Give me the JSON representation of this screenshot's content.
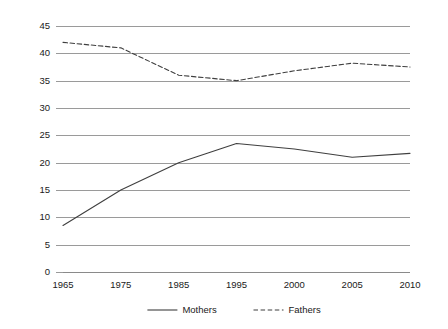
{
  "chart_data": {
    "type": "line",
    "title": "",
    "subtitle": "",
    "xlabel": "",
    "ylabel": "",
    "categories": [
      "1965",
      "1975",
      "1985",
      "1995",
      "2000",
      "2005",
      "2010"
    ],
    "ylim": [
      0,
      45
    ],
    "ytick_step": 5,
    "yticks": [
      "0",
      "5",
      "10",
      "15",
      "20",
      "25",
      "30",
      "35",
      "40",
      "45"
    ],
    "grid": "horizontal",
    "legend_position": "bottom-center",
    "series": [
      {
        "name": "Mothers",
        "style": "solid",
        "color": "#3f3f3f",
        "values": [
          8.5,
          15.0,
          20.0,
          23.5,
          22.5,
          21.0,
          21.7
        ]
      },
      {
        "name": "Fathers",
        "style": "dashed",
        "color": "#3f3f3f",
        "values": [
          42.0,
          41.0,
          36.0,
          35.0,
          36.8,
          38.2,
          37.5
        ]
      }
    ],
    "annotations": []
  },
  "legend": {
    "items": [
      {
        "label": "Mothers",
        "style": "solid"
      },
      {
        "label": "Fathers",
        "style": "dashed"
      }
    ]
  }
}
